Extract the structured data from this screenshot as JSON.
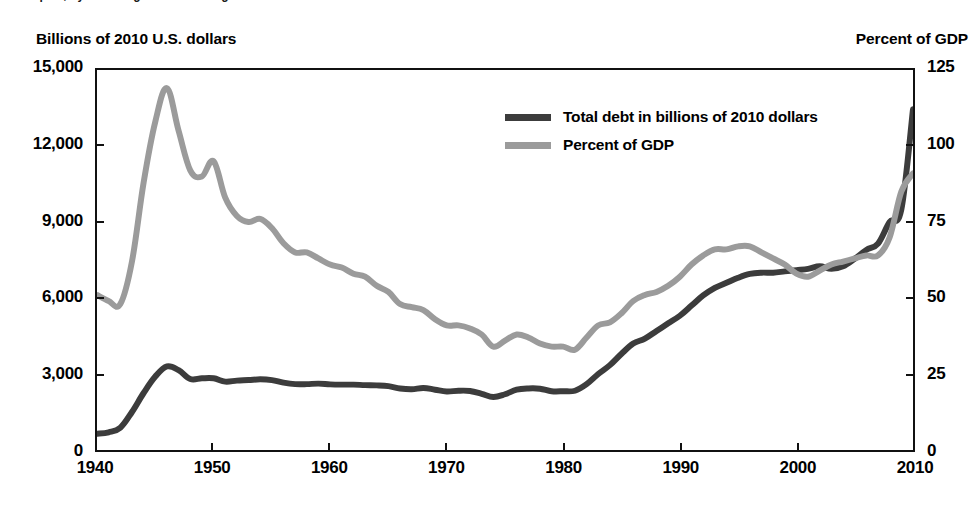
{
  "figure": {
    "top_cropped_caption": "report, by the Congressional Budget Office",
    "left_axis_header": "Billions of 2010 U.S. dollars",
    "right_axis_header": "Percent of GDP"
  },
  "legend": {
    "position": "inside-top-center",
    "items": [
      {
        "label": "Total debt in billions of 2010 dollars",
        "color": "#3c3c3c",
        "swatch": "line-swatch"
      },
      {
        "label": "Percent of GDP",
        "color": "#9b9b9b",
        "swatch": "line-swatch"
      }
    ]
  },
  "axes": {
    "left": {
      "title": "Billions of 2010 U.S. dollars",
      "ticks": [
        "0",
        "3,000",
        "6,000",
        "9,000",
        "12,000",
        "15,000"
      ],
      "values": [
        0,
        3000,
        6000,
        9000,
        12000,
        15000
      ],
      "min": 0,
      "max": 15000
    },
    "right": {
      "title": "Percent of GDP",
      "ticks": [
        "0",
        "25",
        "50",
        "75",
        "100",
        "125"
      ],
      "values": [
        0,
        25,
        50,
        75,
        100,
        125
      ],
      "min": 0,
      "max": 125
    },
    "bottom": {
      "ticks": [
        "1940",
        "1950",
        "1960",
        "1970",
        "1980",
        "1990",
        "2000",
        "2010"
      ],
      "values": [
        1940,
        1950,
        1960,
        1970,
        1980,
        1990,
        2000,
        2010
      ],
      "min": 1940,
      "max": 2010
    }
  },
  "chart_data": {
    "type": "line",
    "title": "",
    "subtitle": "",
    "xlabel": "",
    "ylabel": "Billions of 2010 U.S. dollars",
    "y2label": "Percent of GDP",
    "xlim": [
      1940,
      2010
    ],
    "ylim": [
      0,
      15000
    ],
    "y2lim": [
      0,
      125
    ],
    "grid": false,
    "legend_position": "inside-top-center",
    "x": [
      1940,
      1941,
      1942,
      1943,
      1944,
      1945,
      1946,
      1947,
      1948,
      1949,
      1950,
      1951,
      1952,
      1953,
      1954,
      1955,
      1956,
      1957,
      1958,
      1959,
      1960,
      1961,
      1962,
      1963,
      1964,
      1965,
      1966,
      1967,
      1968,
      1969,
      1970,
      1971,
      1972,
      1973,
      1974,
      1975,
      1976,
      1977,
      1978,
      1979,
      1980,
      1981,
      1982,
      1983,
      1984,
      1985,
      1986,
      1987,
      1988,
      1989,
      1990,
      1991,
      1992,
      1993,
      1994,
      1995,
      1996,
      1997,
      1998,
      1999,
      2000,
      2001,
      2002,
      2003,
      2004,
      2005,
      2006,
      2007,
      2008,
      2009,
      2010
    ],
    "series": [
      {
        "name": "Total debt in billions of 2010 dollars",
        "color": "#3c3c3c",
        "axis": "left",
        "units": "billions of 2010 dollars",
        "values": [
          640,
          700,
          880,
          1500,
          2250,
          2900,
          3300,
          3150,
          2800,
          2830,
          2830,
          2700,
          2740,
          2760,
          2790,
          2760,
          2660,
          2600,
          2600,
          2620,
          2590,
          2580,
          2580,
          2560,
          2550,
          2520,
          2430,
          2400,
          2450,
          2380,
          2310,
          2340,
          2330,
          2220,
          2090,
          2200,
          2380,
          2430,
          2420,
          2320,
          2320,
          2340,
          2600,
          3000,
          3350,
          3800,
          4200,
          4400,
          4700,
          5000,
          5300,
          5700,
          6100,
          6400,
          6600,
          6800,
          6950,
          7000,
          7000,
          7050,
          7100,
          7150,
          7250,
          7150,
          7250,
          7550,
          7900,
          8150,
          9000,
          9500,
          13450
        ]
      },
      {
        "name": "Percent of GDP",
        "color": "#9b9b9b",
        "axis": "right",
        "units": "percent of GDP",
        "values": [
          51,
          49,
          48,
          62,
          88,
          108,
          119,
          105,
          92,
          90,
          95,
          83,
          77,
          75,
          76,
          73,
          68,
          65,
          65,
          63,
          61,
          60,
          58,
          57,
          54,
          52,
          48,
          47,
          46,
          43,
          41,
          41,
          40,
          38,
          34,
          36,
          38,
          37,
          35,
          34,
          34,
          33,
          37,
          41,
          42,
          45,
          49,
          51,
          52,
          54,
          57,
          61,
          64,
          66,
          66,
          67,
          67,
          65,
          63,
          61,
          58,
          57,
          59,
          61,
          62,
          63,
          64,
          64,
          70,
          85,
          91
        ]
      }
    ]
  }
}
